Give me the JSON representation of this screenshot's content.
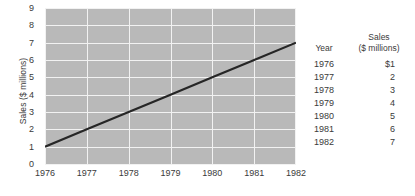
{
  "chart_data": {
    "type": "line",
    "title": "",
    "xlabel": "",
    "ylabel": "Sales ($ millions)",
    "x": [
      1976,
      1977,
      1978,
      1979,
      1980,
      1981,
      1982
    ],
    "values": [
      1,
      2,
      3,
      4,
      5,
      6,
      7
    ],
    "series": [
      {
        "name": "Sales",
        "values": [
          1,
          2,
          3,
          4,
          5,
          6,
          7
        ]
      }
    ],
    "xtick_labels": [
      "1976",
      "1977",
      "1978",
      "1979",
      "1980",
      "1981",
      "1982"
    ],
    "ytick_labels": [
      "0",
      "1",
      "2",
      "3",
      "4",
      "5",
      "6",
      "7",
      "8",
      "9"
    ],
    "ylim": [
      0,
      9
    ],
    "xlim": [
      1976,
      1982
    ],
    "grid": true,
    "legend": "none",
    "plot_background_color": "#b9b9b9",
    "gridline_color": "#f2f2f2",
    "line_color": "#262626",
    "text_color": "#3a3a3a"
  },
  "table": {
    "header": {
      "year": "Year",
      "sales_line1": "Sales",
      "sales_line2": "($ millions)"
    },
    "rows": [
      {
        "year": "1976",
        "sales": "$1"
      },
      {
        "year": "1977",
        "sales": "2"
      },
      {
        "year": "1978",
        "sales": "3"
      },
      {
        "year": "1979",
        "sales": "4"
      },
      {
        "year": "1980",
        "sales": "5"
      },
      {
        "year": "1981",
        "sales": "6"
      },
      {
        "year": "1982",
        "sales": "7"
      }
    ]
  }
}
